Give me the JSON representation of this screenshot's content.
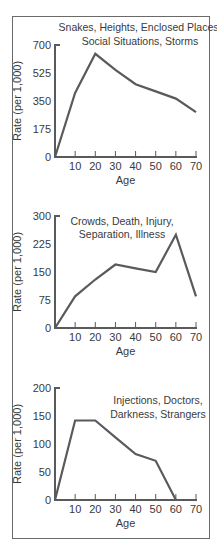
{
  "chart_data": [
    {
      "type": "line",
      "title": "Snakes, Heights, Enclosed Places, Social Situations, Storms",
      "title_lines": [
        "Snakes, Heights, Enclosed Places,",
        "Social Situations, Storms"
      ],
      "xlabel": "Age",
      "ylabel": "Rate (per 1,000)",
      "x": [
        0,
        10,
        20,
        30,
        40,
        50,
        60,
        70
      ],
      "values": [
        0,
        400,
        645,
        545,
        455,
        410,
        365,
        280
      ],
      "xticks": [
        "10",
        "20",
        "30",
        "40",
        "50",
        "60",
        "70"
      ],
      "yticks": [
        "0",
        "175",
        "350",
        "525",
        "700"
      ],
      "ylim": [
        0,
        700
      ],
      "xlim": [
        0,
        70
      ],
      "grid": false
    },
    {
      "type": "line",
      "title": "Crowds, Death, Injury, Separation, Illness",
      "title_lines": [
        "Crowds, Death, Injury,",
        "Separation, Illness"
      ],
      "xlabel": "Age",
      "ylabel": "Rate (per 1,000)",
      "x": [
        0,
        10,
        20,
        30,
        40,
        50,
        60,
        70
      ],
      "values": [
        0,
        85,
        130,
        170,
        160,
        150,
        250,
        85
      ],
      "xticks": [
        "10",
        "20",
        "30",
        "40",
        "50",
        "60",
        "70"
      ],
      "yticks": [
        "0",
        "75",
        "150",
        "225",
        "300"
      ],
      "ylim": [
        0,
        300
      ],
      "xlim": [
        0,
        70
      ],
      "grid": false
    },
    {
      "type": "line",
      "title": "Injections, Doctors, Darkness, Strangers",
      "title_lines": [
        "Injections, Doctors,",
        "Darkness, Strangers"
      ],
      "xlabel": "Age",
      "ylabel": "Rate (per 1,000)",
      "x": [
        0,
        10,
        20,
        30,
        40,
        50,
        60
      ],
      "values": [
        0,
        142,
        142,
        112,
        82,
        70,
        0
      ],
      "xticks": [
        "10",
        "20",
        "30",
        "40",
        "50",
        "60",
        "70"
      ],
      "yticks": [
        "0",
        "50",
        "100",
        "150",
        "200"
      ],
      "ylim": [
        0,
        200
      ],
      "xlim": [
        0,
        70
      ],
      "grid": false
    }
  ],
  "layout": {
    "panels": [
      {
        "x0": 55,
        "y0": 157,
        "ytop": 45,
        "xend": 196,
        "title_x": 140,
        "title_y": [
          31,
          45
        ],
        "title_anchor": "middle",
        "ylabel_y": 101
      },
      {
        "x0": 55,
        "y0": 328,
        "ytop": 216,
        "xend": 196,
        "title_x": 122,
        "title_y": [
          225,
          238
        ],
        "title_anchor": "middle",
        "ylabel_y": 272
      },
      {
        "x0": 55,
        "y0": 500,
        "ytop": 388,
        "xend": 196,
        "title_x": 158,
        "title_y": [
          404,
          418
        ],
        "title_anchor": "middle",
        "ylabel_y": 444
      }
    ]
  }
}
